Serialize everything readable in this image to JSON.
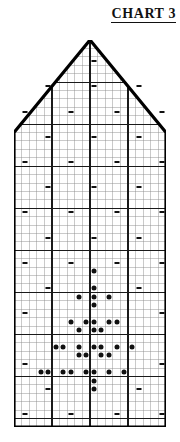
{
  "title": {
    "text": "CHART 3"
  },
  "legend_note": "",
  "chart_data": {
    "type": "grid-pattern-chart",
    "title": "CHART 3",
    "xlabel": "",
    "ylabel": "",
    "columns": 20,
    "rows": 46,
    "cell_width_px": 7.6,
    "cell_height_px": 8.41,
    "grid": true,
    "grid_major_every": 5,
    "legend_position": "none",
    "outline_shape": "pentagon",
    "outline_points_cell_coords": [
      [
        0,
        46
      ],
      [
        0,
        11
      ],
      [
        10,
        0
      ],
      [
        20,
        11
      ],
      [
        20,
        46
      ]
    ],
    "symbols": {
      "dash": {
        "name": "dash",
        "meaning": "dash-stitch-symbol",
        "color": "#111111"
      },
      "dot": {
        "name": "dot",
        "meaning": "bobble-stitch-symbol",
        "color": "#111111"
      }
    },
    "dash_cells": [
      [
        10,
        2
      ],
      [
        4,
        5
      ],
      [
        10,
        5
      ],
      [
        16,
        5
      ],
      [
        1,
        8
      ],
      [
        7,
        8
      ],
      [
        13,
        8
      ],
      [
        19,
        8
      ],
      [
        4,
        11
      ],
      [
        10,
        11
      ],
      [
        16,
        11
      ],
      [
        1,
        14
      ],
      [
        7,
        14
      ],
      [
        13,
        14
      ],
      [
        19,
        14
      ],
      [
        4,
        17
      ],
      [
        10,
        17
      ],
      [
        16,
        17
      ],
      [
        1,
        20
      ],
      [
        7,
        20
      ],
      [
        13,
        20
      ],
      [
        19,
        20
      ],
      [
        4,
        23
      ],
      [
        10,
        23
      ],
      [
        16,
        23
      ],
      [
        1,
        26
      ],
      [
        7,
        26
      ],
      [
        13,
        26
      ],
      [
        19,
        26
      ],
      [
        4,
        29
      ],
      [
        16,
        29
      ],
      [
        1,
        32
      ],
      [
        19,
        32
      ],
      [
        1,
        38
      ],
      [
        19,
        38
      ],
      [
        4,
        41
      ],
      [
        16,
        41
      ],
      [
        1,
        44
      ],
      [
        7,
        44
      ],
      [
        13,
        44
      ],
      [
        19,
        44
      ]
    ],
    "dot_cells": [
      [
        10,
        27
      ],
      [
        10,
        29
      ],
      [
        8,
        30
      ],
      [
        10,
        30
      ],
      [
        12,
        30
      ],
      [
        10,
        31
      ],
      [
        7,
        33
      ],
      [
        9,
        33
      ],
      [
        10,
        33
      ],
      [
        12,
        33
      ],
      [
        13,
        33
      ],
      [
        8,
        34
      ],
      [
        10,
        34
      ],
      [
        11,
        34
      ],
      [
        5,
        36
      ],
      [
        6,
        36
      ],
      [
        8,
        36
      ],
      [
        10,
        36
      ],
      [
        11,
        36
      ],
      [
        13,
        36
      ],
      [
        15,
        36
      ],
      [
        8,
        37
      ],
      [
        9,
        37
      ],
      [
        11,
        37
      ],
      [
        12,
        37
      ],
      [
        3,
        39
      ],
      [
        4,
        39
      ],
      [
        6,
        39
      ],
      [
        7,
        39
      ],
      [
        9,
        39
      ],
      [
        10,
        39
      ],
      [
        12,
        39
      ],
      [
        14,
        39
      ],
      [
        10,
        40
      ],
      [
        10,
        41
      ]
    ]
  }
}
